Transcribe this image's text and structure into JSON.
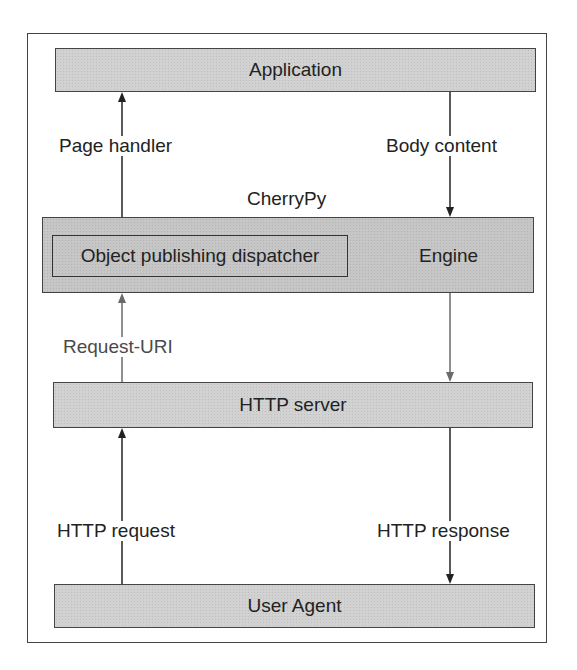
{
  "diagram": {
    "type": "layered architecture flow",
    "title": "CherryPy",
    "boxes": {
      "application": "Application",
      "engine": "Engine",
      "dispatcher": "Object publishing dispatcher",
      "http_server": "HTTP server",
      "user_agent": "User Agent"
    },
    "edges": {
      "page_handler": "Page handler",
      "body_content": "Body content",
      "request_uri": "Request-URI",
      "http_request": "HTTP request",
      "http_response": "HTTP response"
    },
    "colors": {
      "box_fill": "#d2d2d2",
      "engine_fill": "#c6c6c6",
      "border": "#444444",
      "arrow_dark": "#222222",
      "arrow_gray": "#6a6a6a"
    }
  }
}
